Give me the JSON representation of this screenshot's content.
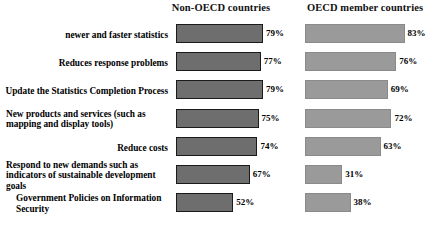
{
  "chart_data": {
    "type": "bar",
    "title": "",
    "xlabel": "",
    "ylabel": "",
    "orientation": "horizontal",
    "value_suffix": "%",
    "xlim": [
      0,
      100
    ],
    "grid": false,
    "legend_position": "top",
    "categories": [
      "newer and faster statistics",
      "Reduces response problems",
      "Update the Statistics Completion Process",
      "New products and services (such as mapping and display tools)",
      "Reduce costs",
      "Respond to new demands such as indicators of sustainable development goals",
      "Government Policies on Information Security"
    ],
    "series": [
      {
        "name": "Non-OECD countries",
        "values": [
          79,
          77,
          79,
          75,
          74,
          67,
          52
        ]
      },
      {
        "name": "OECD member countries",
        "values": [
          83,
          76,
          69,
          72,
          63,
          31,
          38
        ]
      }
    ],
    "colors": {
      "non_oecd_fill": "#6e6e6e",
      "non_oecd_border": "#1a1a1a",
      "oecd_fill": "#9a9a9a",
      "oecd_border": "#8a8a8a",
      "background": "#ffffff",
      "text": "#000000"
    }
  },
  "headers": {
    "left": "Non-OECD countries",
    "right": "OECD member countries"
  },
  "rows": [
    {
      "label": "newer and faster statistics",
      "label_align": "align-right",
      "left_value": 79,
      "left_value_text": "79%",
      "right_value": 83,
      "right_value_text": "83%"
    },
    {
      "label": "Reduces response problems",
      "label_align": "align-right",
      "left_value": 77,
      "left_value_text": "77%",
      "right_value": 76,
      "right_value_text": "76%"
    },
    {
      "label": "Update the Statistics Completion Process",
      "label_align": "align-right",
      "left_value": 79,
      "left_value_text": "79%",
      "right_value": 69,
      "right_value_text": "69%"
    },
    {
      "label": "New products and services (such as mapping and display tools)",
      "label_align": "align-left",
      "left_value": 75,
      "left_value_text": "75%",
      "right_value": 72,
      "right_value_text": "72%"
    },
    {
      "label": "Reduce costs",
      "label_align": "align-right",
      "left_value": 74,
      "left_value_text": "74%",
      "right_value": 63,
      "right_value_text": "63%"
    },
    {
      "label": "Respond to new demands such as indicators of sustainable development goals",
      "label_align": "align-left",
      "left_value": 67,
      "left_value_text": "67%",
      "right_value": 31,
      "right_value_text": "31%"
    },
    {
      "label": "Government Policies on Information Security",
      "label_align": "align-leftish",
      "left_value": 52,
      "left_value_text": "52%",
      "right_value": 38,
      "right_value_text": "38%"
    }
  ]
}
